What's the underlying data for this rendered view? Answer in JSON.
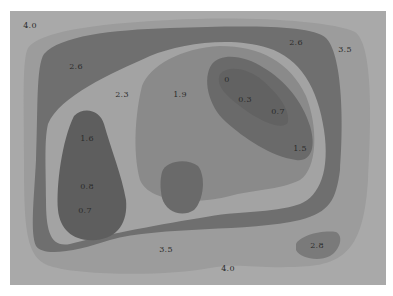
{
  "map": {
    "type": "contour-map",
    "colors": {
      "background": "#ffffff",
      "level_4_0": "#a9a9a9",
      "level_3_5": "#9c9c9c",
      "level_2_6": "#6f6f6f",
      "level_2_3": "#a3a3a3",
      "level_1_9": "#8a8a8a",
      "level_low": "#6a6a6a",
      "level_core": "#5e5e5e",
      "text": "#2b2b2b"
    },
    "labels": [
      {
        "id": "top-left",
        "text": "4.0",
        "x": 30,
        "y": 25
      },
      {
        "id": "upper-left-band",
        "text": "2.6",
        "x": 76,
        "y": 66
      },
      {
        "id": "top-right-band",
        "text": "2.6",
        "x": 296,
        "y": 42
      },
      {
        "id": "top-right-outer",
        "text": "3.5",
        "x": 345,
        "y": 49
      },
      {
        "id": "inner-ring",
        "text": "2.3",
        "x": 122,
        "y": 94
      },
      {
        "id": "center",
        "text": "1.9",
        "x": 180,
        "y": 94
      },
      {
        "id": "depression-top",
        "text": "0",
        "x": 227,
        "y": 79
      },
      {
        "id": "depression-mid",
        "text": "0.3",
        "x": 245,
        "y": 99
      },
      {
        "id": "depression-right",
        "text": "0.7",
        "x": 278,
        "y": 111
      },
      {
        "id": "right-inner",
        "text": "1.5",
        "x": 300,
        "y": 148
      },
      {
        "id": "left-basin-top",
        "text": "1.6",
        "x": 87,
        "y": 138
      },
      {
        "id": "left-basin-mid",
        "text": "0.8",
        "x": 87,
        "y": 186
      },
      {
        "id": "left-basin-bottom",
        "text": "0.7",
        "x": 85,
        "y": 210
      },
      {
        "id": "bottom-band",
        "text": "3.5",
        "x": 166,
        "y": 249
      },
      {
        "id": "bottom-right-pit",
        "text": "2.8",
        "x": 317,
        "y": 245
      },
      {
        "id": "bottom-center",
        "text": "4.0",
        "x": 228,
        "y": 268
      }
    ]
  }
}
